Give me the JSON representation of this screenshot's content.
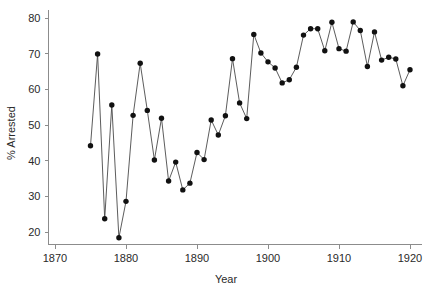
{
  "chart_data": {
    "type": "line",
    "title": "",
    "subtitle": "",
    "xlabel": "Year",
    "ylabel": "% Arrested",
    "xlim": [
      1868,
      1922
    ],
    "ylim": [
      17,
      81
    ],
    "xticks": [
      1870,
      1880,
      1890,
      1900,
      1910,
      1920
    ],
    "xticklabels": [
      "1870",
      "1880",
      "1890",
      "1900",
      "1910",
      "1920"
    ],
    "yticks": [
      20,
      30,
      40,
      50,
      60,
      70,
      80
    ],
    "yticklabels": [
      "20",
      "30",
      "40",
      "50",
      "60",
      "70",
      "80"
    ],
    "grid": false,
    "legend": null,
    "legend_position": "none",
    "marker": "filled-circle",
    "line_color": "#4a4a4a",
    "marker_color": "#111111",
    "x": [
      1875,
      1876,
      1877,
      1878,
      1879,
      1880,
      1881,
      1882,
      1883,
      1884,
      1885,
      1886,
      1887,
      1888,
      1889,
      1890,
      1891,
      1892,
      1893,
      1894,
      1895,
      1896,
      1897,
      1898,
      1899,
      1900,
      1901,
      1902,
      1903,
      1904,
      1905,
      1906,
      1907,
      1908,
      1909,
      1910,
      1911,
      1912,
      1913,
      1914,
      1915,
      1916,
      1917,
      1918,
      1919,
      1920
    ],
    "y": [
      44.2,
      69.9,
      23.7,
      55.6,
      18.4,
      28.6,
      52.7,
      67.3,
      54.1,
      40.2,
      51.9,
      34.3,
      39.6,
      31.8,
      33.7,
      42.3,
      40.3,
      51.4,
      47.2,
      52.6,
      68.6,
      56.2,
      51.8,
      75.4,
      70.2,
      67.7,
      66.0,
      61.8,
      62.7,
      66.2,
      75.2,
      77.0,
      77.0,
      70.8,
      78.8,
      71.4,
      70.7,
      78.9,
      76.5,
      66.4,
      76.1,
      68.2,
      69.0,
      68.5,
      61.0,
      65.5
    ],
    "annotations": []
  },
  "axes": {
    "x_title": "Year",
    "y_title": "% Arrested"
  }
}
